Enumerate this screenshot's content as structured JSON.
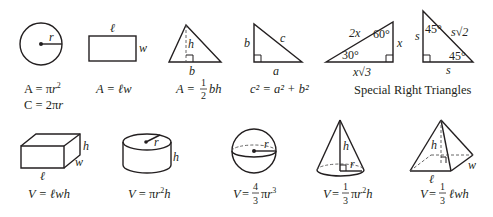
{
  "colors": {
    "ink": "#231f20",
    "background": "#ffffff"
  },
  "shapes": {
    "circle": {
      "labels": {
        "r": "r"
      },
      "formula_area": "A = πr²",
      "formula_area_parts": [
        "A = π",
        "r",
        "2"
      ],
      "formula_circumference": "C = 2πr",
      "formula_circumference_parts": [
        "C = 2π",
        "r"
      ]
    },
    "rectangle": {
      "labels": {
        "l": "ℓ",
        "w": "w"
      },
      "formula": "A = ℓw"
    },
    "triangle": {
      "labels": {
        "h": "h",
        "b": "b"
      },
      "formula": "A = ½bh",
      "formula_parts": [
        "A =",
        "1",
        "2",
        "bh"
      ]
    },
    "right_triangle": {
      "labels": {
        "a": "a",
        "b": "b",
        "c": "c"
      },
      "formula": "c² = a² + b²"
    },
    "special_30_60_90": {
      "labels": {
        "hyp": "2x",
        "short": "x",
        "long": "x√3",
        "angle_small": "30°",
        "angle_large": "60°"
      }
    },
    "special_45_45_90": {
      "labels": {
        "leg_side": "s",
        "leg_bottom": "s",
        "hyp": "s√2",
        "angle_top": "45°",
        "angle_bottom": "45°"
      }
    },
    "special_caption": "Special Right Triangles",
    "rect_prism": {
      "labels": {
        "l": "ℓ",
        "w": "w",
        "h": "h"
      },
      "formula": "V = ℓwh"
    },
    "cylinder": {
      "labels": {
        "r": "r",
        "h": "h"
      },
      "formula": "V = πr²h"
    },
    "sphere": {
      "labels": {
        "r": "r"
      },
      "formula": "V = 4/3 πr³",
      "formula_parts": [
        "V =",
        "4",
        "3",
        "πr",
        "3"
      ]
    },
    "cone": {
      "labels": {
        "h": "h",
        "r": "r"
      },
      "formula": "V = 1/3 πr²h",
      "formula_parts": [
        "V =",
        "1",
        "3",
        "πr",
        "2",
        "h"
      ]
    },
    "pyramid": {
      "labels": {
        "h": "h",
        "l": "ℓ",
        "w": "w"
      },
      "formula": "V = 1/3 ℓwh",
      "formula_parts": [
        "V =",
        "1",
        "3",
        "ℓwh"
      ]
    }
  }
}
